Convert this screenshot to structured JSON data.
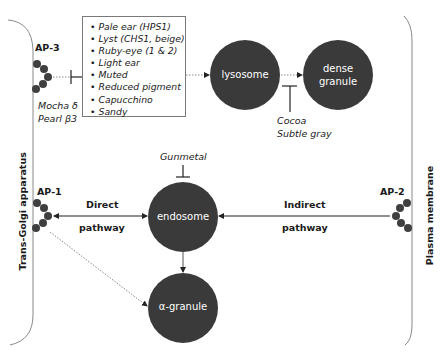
{
  "membranes": {
    "left": {
      "label": "Trans-Golgi apparatus"
    },
    "right": {
      "label": "Plasma membrane"
    }
  },
  "adaptors": {
    "ap3": {
      "label": "AP-3",
      "mutants": [
        "Mocha δ",
        "Pearl β3"
      ]
    },
    "ap1": {
      "label": "AP-1"
    },
    "ap2": {
      "label": "AP-2"
    }
  },
  "mutant_list": {
    "items": [
      "Pale ear (HPS1)",
      "Lyst (CHS1, beige)",
      "Ruby-eye (1 & 2)",
      "Light ear",
      "Muted",
      "Reduced pigment",
      "Capucchino",
      "Sandy"
    ]
  },
  "organelles": {
    "lysosome": {
      "label": "lysosome"
    },
    "dense_granule": {
      "label_line1": "dense",
      "label_line2": "granule"
    },
    "endosome": {
      "label": "endosome"
    },
    "alpha_granule": {
      "label": "α-granule"
    }
  },
  "inhibitors": {
    "gunmetal": {
      "label": "Gunmetal"
    },
    "cocoa": {
      "line1": "Cocoa",
      "line2": "Subtle gray"
    }
  },
  "pathways": {
    "direct": {
      "line1": "Direct",
      "line2": "pathway"
    },
    "indirect": {
      "line1": "Indirect",
      "line2": "pathway"
    }
  },
  "colors": {
    "organelle_fill": "#3a3a3a",
    "coat_dot": "#3f3f3f",
    "membrane_line": "#8a8a8a",
    "arrow": "#222222",
    "dotted_arrow": "#888888"
  }
}
